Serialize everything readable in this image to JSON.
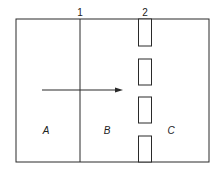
{
  "diagram": {
    "boundary_labels": [
      "1",
      "2"
    ],
    "region_labels": [
      "A",
      "B",
      "C"
    ],
    "arrow": "flow-arrow",
    "colors": {
      "line": "#2a2a2a",
      "background": "#ffffff"
    }
  }
}
